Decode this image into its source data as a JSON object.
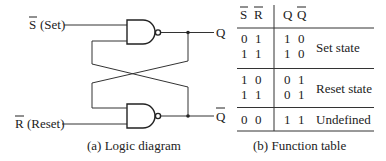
{
  "logic_diagram": {
    "inputs": {
      "set": {
        "symbol": "S",
        "overbar": true,
        "label": "(Set)"
      },
      "reset": {
        "symbol": "R",
        "overbar": true,
        "label": "(Reset)"
      }
    },
    "outputs": {
      "q": {
        "symbol": "Q",
        "overbar": false
      },
      "q_bar": {
        "symbol": "Q",
        "overbar": true
      }
    },
    "gates": [
      {
        "type": "NAND",
        "position": "top"
      },
      {
        "type": "NAND",
        "position": "bottom"
      }
    ],
    "caption": "(a) Logic diagram"
  },
  "function_table": {
    "headers": {
      "s": "S",
      "r": "R",
      "q": "Q",
      "q_bar": "Q"
    },
    "groups": [
      {
        "rows": [
          {
            "s": "0",
            "r": "1",
            "q": "1",
            "q_bar": "0"
          },
          {
            "s": "1",
            "r": "1",
            "q": "1",
            "q_bar": "0"
          }
        ],
        "state": "Set state"
      },
      {
        "rows": [
          {
            "s": "1",
            "r": "0",
            "q": "0",
            "q_bar": "1"
          },
          {
            "s": "1",
            "r": "1",
            "q": "0",
            "q_bar": "1"
          }
        ],
        "state": "Reset state"
      },
      {
        "rows": [
          {
            "s": "0",
            "r": "0",
            "q": "1",
            "q_bar": "1"
          }
        ],
        "state": "Undefined"
      }
    ],
    "caption": "(b) Function table"
  }
}
